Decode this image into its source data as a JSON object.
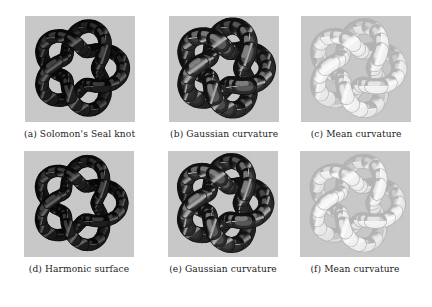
{
  "figure": {
    "background_color": "#ffffff",
    "panel_background_color": "#c9c9c9",
    "caption_color": "#1b1b1b"
  },
  "panels": [
    {
      "id": "panel-a",
      "caption": "(a) Solomon's Seal knot",
      "render": "solid-dark",
      "knot": {
        "type": "torus-knot",
        "p": 5,
        "q": 2,
        "tube_radius": 0.2
      },
      "colors": {
        "base": "#1d1d1d",
        "shade_dark": "#070707",
        "shade_light": "#4a4a4a",
        "highlight": "#6d6d6d"
      }
    },
    {
      "id": "panel-b",
      "caption": "(b) Gaussian curvature",
      "render": "gaussian-curvature",
      "knot": {
        "type": "torus-knot",
        "p": 5,
        "q": 2,
        "tube_radius": 0.26
      },
      "colors": {
        "base": "#2b2b2b",
        "shade_dark": "#101010",
        "shade_light": "#9a9a9a",
        "highlight": "#c2c2c2"
      }
    },
    {
      "id": "panel-c",
      "caption": "(c) Mean curvature",
      "render": "mean-curvature",
      "knot": {
        "type": "torus-knot",
        "p": 5,
        "q": 2,
        "tube_radius": 0.24
      },
      "colors": {
        "base": "#f2f2f2",
        "shade_dark": "#b4b4b4",
        "shade_light": "#fbfbfb",
        "highlight": "#ffffff"
      }
    },
    {
      "id": "panel-d",
      "caption": "(d) Harmonic surface",
      "render": "solid-dark",
      "knot": {
        "type": "torus-knot",
        "p": 5,
        "q": 2,
        "tube_radius": 0.18
      },
      "colors": {
        "base": "#1d1d1d",
        "shade_dark": "#070707",
        "shade_light": "#4a4a4a",
        "highlight": "#6d6d6d"
      }
    },
    {
      "id": "panel-e",
      "caption": "(e) Gaussian curvature",
      "render": "gaussian-curvature",
      "knot": {
        "type": "torus-knot",
        "p": 5,
        "q": 2,
        "tube_radius": 0.24
      },
      "colors": {
        "base": "#2b2b2b",
        "shade_dark": "#101010",
        "shade_light": "#9a9a9a",
        "highlight": "#c2c2c2"
      }
    },
    {
      "id": "panel-f",
      "caption": "(f) Mean curvature",
      "render": "mean-curvature",
      "knot": {
        "type": "torus-knot",
        "p": 5,
        "q": 2,
        "tube_radius": 0.22
      },
      "colors": {
        "base": "#f2f2f2",
        "shade_dark": "#b4b4b4",
        "shade_light": "#fbfbfb",
        "highlight": "#ffffff"
      }
    }
  ]
}
